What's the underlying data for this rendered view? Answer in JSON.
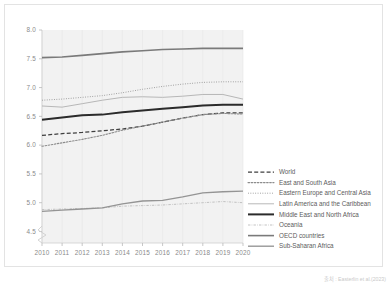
{
  "figure": {
    "credit": "출처 : Easterlin et al.(2023)"
  },
  "chart_data": {
    "type": "line",
    "title": "",
    "subtitle": "",
    "xlabel": "",
    "ylabel": "",
    "x": [
      2010,
      2011,
      2012,
      2013,
      2014,
      2015,
      2016,
      2017,
      2018,
      2019,
      2020
    ],
    "xtick_labels": [
      "2010",
      "2011",
      "2012",
      "2013",
      "2014",
      "2015",
      "2016",
      "2017",
      "2018",
      "2019",
      "2020"
    ],
    "ytick_labels": [
      "4.5",
      "5.0",
      "5.5",
      "6.0",
      "6.5",
      "7.0",
      "7.5",
      "8.0"
    ],
    "ytick_values": [
      4.5,
      5.0,
      5.5,
      6.0,
      6.5,
      7.0,
      7.5,
      8.0
    ],
    "ylim": [
      4.3,
      8.0
    ],
    "xlim": [
      2010,
      2020
    ],
    "y_axis_break": true,
    "grid": "vertical-faint",
    "legend_position": "right",
    "plot_background": "#f2f2f2",
    "series": [
      {
        "name": "World",
        "style": "dashed",
        "color": "#3f3f3f",
        "width": 1.25,
        "values": [
          6.17,
          6.2,
          6.22,
          6.25,
          6.28,
          6.33,
          6.4,
          6.47,
          6.53,
          6.56,
          6.56
        ]
      },
      {
        "name": "East and South Asia",
        "style": "dotted-circles",
        "color": "#8c8c8c",
        "width": 1.1,
        "values": [
          5.98,
          6.04,
          6.1,
          6.17,
          6.26,
          6.33,
          6.4,
          6.47,
          6.53,
          6.55,
          6.54
        ]
      },
      {
        "name": "Eastern Europe and Central Asia",
        "style": "fine-dotted",
        "color": "#9a9a9a",
        "width": 1.0,
        "values": [
          6.78,
          6.8,
          6.83,
          6.86,
          6.91,
          6.97,
          7.02,
          7.06,
          7.09,
          7.1,
          7.1
        ]
      },
      {
        "name": "Latin America and the Caribbean",
        "style": "thin-solid",
        "color": "#b0b0b0",
        "width": 0.9,
        "values": [
          6.68,
          6.66,
          6.72,
          6.78,
          6.83,
          6.84,
          6.83,
          6.85,
          6.88,
          6.88,
          6.8
        ]
      },
      {
        "name": "Middle East and North Africa",
        "style": "bold-solid",
        "color": "#2b2b2b",
        "width": 2.0,
        "values": [
          6.44,
          6.48,
          6.52,
          6.53,
          6.57,
          6.6,
          6.63,
          6.66,
          6.69,
          6.7,
          6.7
        ]
      },
      {
        "name": "Oceania",
        "style": "thin-dashdot",
        "color": "#b8b8b8",
        "width": 0.85,
        "values": [
          4.88,
          4.89,
          4.9,
          4.91,
          4.94,
          4.95,
          4.96,
          4.98,
          5.0,
          5.02,
          5.0
        ]
      },
      {
        "name": "OECD countries",
        "style": "solid",
        "color": "#7a7a7a",
        "width": 1.6,
        "values": [
          7.52,
          7.53,
          7.56,
          7.59,
          7.62,
          7.64,
          7.66,
          7.67,
          7.68,
          7.68,
          7.68
        ]
      },
      {
        "name": "Sub-Saharan Africa",
        "style": "solid",
        "color": "#949494",
        "width": 1.35,
        "values": [
          4.85,
          4.87,
          4.89,
          4.91,
          4.98,
          5.03,
          5.04,
          5.1,
          5.17,
          5.19,
          5.2
        ]
      }
    ],
    "legend_entries": [
      {
        "label": "World",
        "style": "dashed",
        "color": "#3f3f3f"
      },
      {
        "label": "East and South Asia",
        "style": "dotted-circles",
        "color": "#8c8c8c"
      },
      {
        "label": "Eastern Europe and Central Asia",
        "style": "fine-dotted",
        "color": "#9a9a9a"
      },
      {
        "label": "Latin America and the Caribbean",
        "style": "thin-solid",
        "color": "#b0b0b0"
      },
      {
        "label": "Middle East and North Africa",
        "style": "bold-solid",
        "color": "#2b2b2b"
      },
      {
        "label": "Oceania",
        "style": "thin-dashdot",
        "color": "#b8b8b8"
      },
      {
        "label": "OECD countries",
        "style": "solid",
        "color": "#7a7a7a"
      },
      {
        "label": "Sub-Saharan Africa",
        "style": "solid",
        "color": "#949494"
      }
    ]
  }
}
